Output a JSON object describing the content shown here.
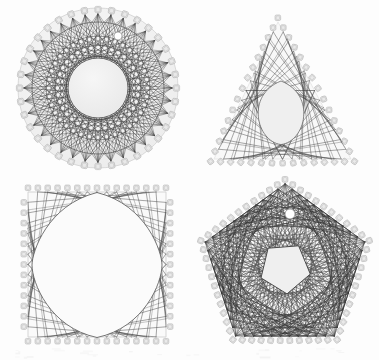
{
  "page": {
    "width": 379,
    "height": 360,
    "background_color": "#fdfdfd"
  },
  "colors": {
    "background": "#fdfdfd",
    "board_fill": "#f4f4f4",
    "board_edge": "#c9c9c9",
    "inner_void_fill": "#efefef",
    "inner_void_fill_light": "#fafafa",
    "thread_dark": "#2e2e2e",
    "thread_mid": "#5a5a5a",
    "thread_light": "#8e8e8e",
    "peg_fill": "#e9e9e9",
    "peg_edge": "#a8a8a8",
    "hang_hole": "#ffffff",
    "scan_noise": "#ededed"
  },
  "figures": [
    {
      "id": "figure-circle",
      "name": "circle-string-art",
      "shape": "circle",
      "label": "",
      "position": "top-left",
      "center": [
        98,
        88
      ],
      "outer_radius": 80,
      "peg_ring_radius": 74,
      "peg_count": 36,
      "inner_void_radius": 30,
      "envelope_rings": [
        66,
        52,
        38
      ],
      "thread_steps": [
        11,
        13,
        17
      ],
      "thread_color": "#3a3a3a",
      "density": "high",
      "has_hang_hole": true,
      "hang_hole": [
        118,
        36
      ],
      "hang_hole_radius": 4
    },
    {
      "id": "figure-triangle",
      "name": "triangle-string-art",
      "shape": "triangle",
      "label": "",
      "position": "top-right",
      "center": [
        281,
        112
      ],
      "vertices": [
        [
          278,
          22
        ],
        [
          214,
          159
        ],
        [
          351,
          159
        ]
      ],
      "pegs_per_side": 14,
      "inner_void_radius": 31,
      "thread_steps": [
        1
      ],
      "thread_color": "#4a4a4a",
      "density": "low",
      "has_hang_hole": false
    },
    {
      "id": "figure-square",
      "name": "square-string-art",
      "shape": "square",
      "label": "",
      "position": "bottom-left",
      "center": [
        97,
        265
      ],
      "corners": [
        [
          28,
          192
        ],
        [
          166,
          192
        ],
        [
          166,
          337
        ],
        [
          28,
          337
        ]
      ],
      "pegs_per_side": 14,
      "inner_void_radius": 50,
      "thread_steps": [
        1
      ],
      "thread_color": "#4a4a4a",
      "density": "low",
      "has_hang_hole": false
    },
    {
      "id": "figure-pentagon",
      "name": "pentagon-string-art",
      "shape": "pentagon",
      "label": "",
      "position": "bottom-right",
      "center": [
        285,
        268
      ],
      "circumradius": 84,
      "peg_ring_radius": 78,
      "pegs_per_side": 11,
      "inner_void_radius": 26,
      "thread_steps": [
        9,
        13,
        16,
        21
      ],
      "thread_color": "#2b2b2b",
      "density": "very-high",
      "has_hang_hole": true,
      "hang_hole": [
        290,
        214
      ],
      "hang_hole_radius": 5
    }
  ],
  "caption": {
    "text": "",
    "visible": false
  }
}
